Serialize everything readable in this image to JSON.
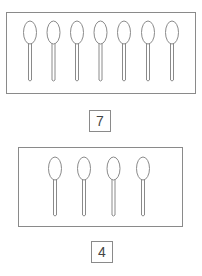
{
  "stroke_color": "#8a8a8a",
  "groups": [
    {
      "name": "top-group",
      "object": "spoon",
      "count_label": "7",
      "spoon_count": 7
    },
    {
      "name": "bottom-group",
      "object": "spoon",
      "count_label": "4",
      "spoon_count": 4
    }
  ]
}
